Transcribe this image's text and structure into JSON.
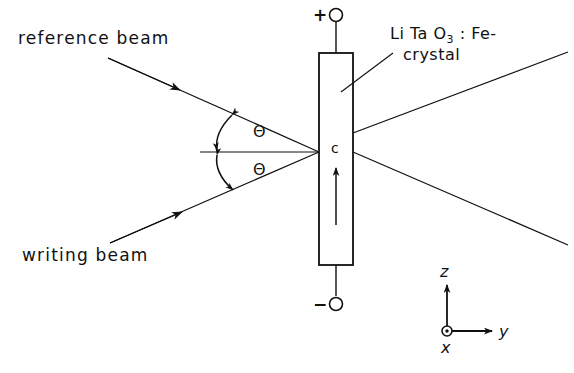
{
  "figure": {
    "background_color": "#ffffff",
    "line_color": "#111111",
    "width": 574,
    "height": 373
  },
  "labels": {
    "reference_beam": "reference beam",
    "writing_beam": "writing beam",
    "crystal_line1_prefix": "Li Ta O",
    "crystal_line1_subscript": "3",
    "crystal_line1_suffix": " : Fe-",
    "crystal_line2": "crystal",
    "theta_upper": "Θ",
    "theta_lower": "Θ",
    "c_axis": "c",
    "terminal_positive": "+",
    "terminal_negative": "−"
  },
  "axes": {
    "z_label": "z",
    "y_label": "y",
    "x_label": "x",
    "x_note": "out-of-page (circle with dot)"
  },
  "icons": {
    "electrode_terminal": "open-circle",
    "x_axis_marker": "circle-dot-out-of-page",
    "beam_direction": "solid-arrowhead",
    "angle_marker": "double-headed-arc"
  }
}
